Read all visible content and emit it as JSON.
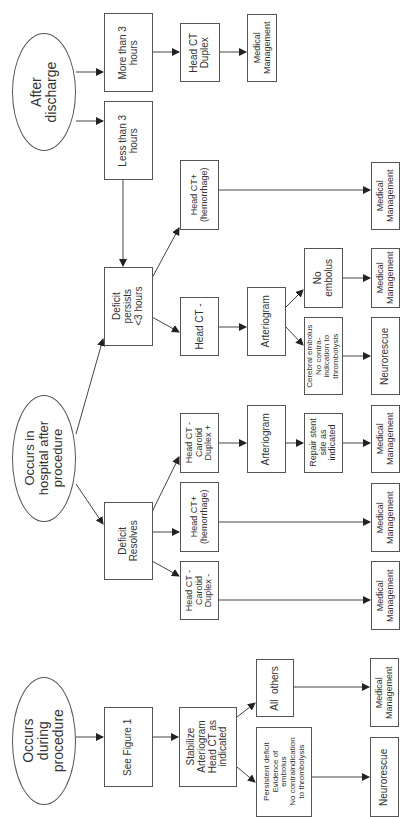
{
  "diagram": {
    "orientation": "rotated -90deg (reads bottom-to-top)",
    "branches": {
      "after_discharge": {
        "root": "After\ndischarge",
        "more_than_3h": "More than 3\nhours",
        "head_ct_duplex": "Head CT\nDuplex",
        "mm_more": "Medical\nManagement",
        "less_than_3h": "Less than 3\nhours"
      },
      "in_hospital": {
        "root": "Occurs in\nhospital after\nprocedure",
        "deficit_persists": "Deficit\npersists\n<3 hours",
        "persist_ct_plus": "Head CT+\n(hemorrhage)",
        "persist_ct_plus_mm": "Medical\nManagement",
        "persist_ct_minus": "Head CT -",
        "persist_arteriogram": "Arteriogram",
        "no_embolus": "No\nembolus",
        "no_embolus_mm": "Medical\nManagement",
        "cerebral_embolus": "Cerebral embolus\nNo contra-\nindication to\nthrombolysis",
        "cerebral_neurorescue": "Neurorescue",
        "deficit_resolves": "Deficit\nResolves",
        "resolves_ct_minus_dup_plus": "Head CT -\nCarotid\nDuplex +",
        "resolves_arteriogram": "Arteriogram",
        "repair_stent": "Repair stent\nsite as\nindicated",
        "repair_mm": "Medical\nManagement",
        "resolves_ct_plus": "Head CT+\n(hemorrhage)",
        "resolves_ct_plus_mm": "Medical\nManagement",
        "resolves_ct_minus_dup_minus": "Head CT -\nCarotid\nDuplex -",
        "resolves_dup_minus_mm": "Medical\nManagement"
      },
      "during_procedure": {
        "root": "Occurs\nduring\nprocedure",
        "see_figure": "See Figure 1",
        "stabilize": "Stabilize\nArteriogram\nHead CT as\nindicated",
        "all_others": "All  others",
        "all_others_mm": "Medical\nManagement",
        "persistent_deficit": "Persistent deficit\nEvidence of\nembolus\nNo contraindication\nto thrombolysis",
        "persistent_neurorescue": "Neurorescue"
      }
    },
    "colors": {
      "line": "#333333",
      "border": "#555555",
      "background": "#ffffff"
    }
  }
}
